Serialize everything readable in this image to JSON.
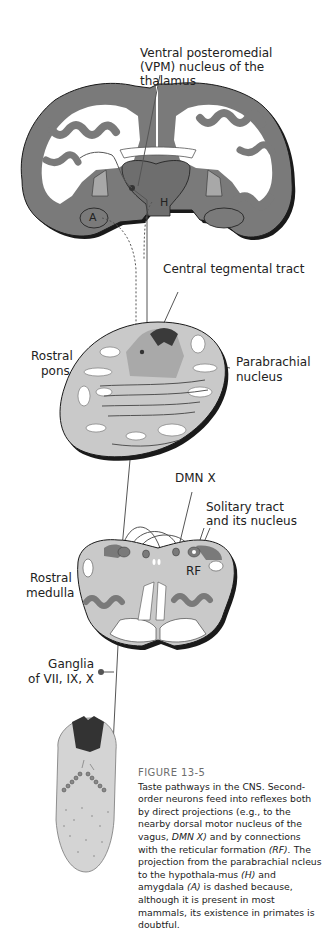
{
  "colors": {
    "cortex": "#7a7a7a",
    "cortex_shadow": "#1a1a1a",
    "brainstem": "#c9c9c9",
    "nucleus_dark": "#555555",
    "pathway": "#555555",
    "caption_title": "#6d6d6d"
  },
  "labels": {
    "vpm_line1": "Ventral posteromedial",
    "vpm_line2": "(VPM) nucleus of the thalamus",
    "hypothalamus": "H",
    "amygdala": "A",
    "central_tegmental": "Central tegmental tract",
    "rostral_pons_1": "Rostral",
    "rostral_pons_2": "pons",
    "parabrachial_1": "Parabrachial",
    "parabrachial_2": "nucleus",
    "dmn": "DMN X",
    "solitary_1": "Solitary tract",
    "solitary_2": "and its nucleus",
    "rf": "RF",
    "rostral_medulla_1": "Rostral",
    "rostral_medulla_2": "medulla",
    "ganglia_1": "Ganglia",
    "ganglia_2": "of VII, IX, X"
  },
  "caption": {
    "title": "FIGURE 13-5",
    "text_1": "Taste pathways in the CNS. Second-order neurons feed into reflexes both by direct projections (e.g., to the nearby dorsal motor nucleus of the vagus, ",
    "em_1": "DMN X)",
    "text_2": " and by connections with the reticular formation ",
    "em_2": "(RF).",
    "text_3": " The projection from the parabrachial ncleus to the hypothala-mus ",
    "em_3": "(H)",
    "text_4": " and amygdala ",
    "em_4": "(A)",
    "text_5": " is dashed because, although it is present in most mammals, its existence in primates is doubtful."
  }
}
